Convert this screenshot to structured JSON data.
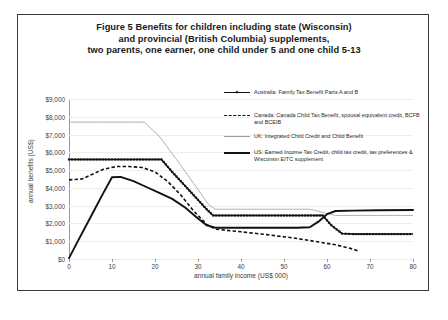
{
  "figure": {
    "title_lines": [
      "Figure 5   Benefits for children including state (Wisconsin)",
      "and provincial (British Columbia) supplements,",
      "two parents, one earner, one child under 5 and one child 5-13"
    ]
  },
  "chart_data": {
    "type": "line",
    "title": "Figure 5   Benefits for children including state (Wisconsin) and provincial (British Columbia) supplements, two parents, one earner, one child under 5 and one child 5-13",
    "xlabel": "annual family income (US$ 000)",
    "ylabel": "annual benefits (US$)",
    "xlim": [
      0,
      80
    ],
    "ylim": [
      0,
      9000
    ],
    "xticks": [
      0,
      10,
      20,
      30,
      40,
      50,
      60,
      70,
      80
    ],
    "xticklabels": [
      "0",
      "10",
      "20",
      "30",
      "40",
      "50",
      "60",
      "70",
      "80"
    ],
    "yticks": [
      0,
      1000,
      2000,
      3000,
      4000,
      5000,
      6000,
      7000,
      8000,
      9000
    ],
    "yticklabels": [
      "$0",
      "$1,000",
      "$2,000",
      "$3,000",
      "$4,000",
      "$5,000",
      "$6,000",
      "$7,000",
      "$8,000",
      "$9,000"
    ],
    "grid": false,
    "legend_position": "upper right",
    "series": [
      {
        "name": "Australia: Family Tax Benefit Parts A and B",
        "key": "australia",
        "style": "solid-with-markers",
        "color": "#111111",
        "points": [
          [
            0,
            5600
          ],
          [
            10,
            5600
          ],
          [
            18,
            5600
          ],
          [
            21.5,
            5600
          ],
          [
            24,
            4900
          ],
          [
            28,
            3850
          ],
          [
            32,
            2800
          ],
          [
            33.5,
            2450
          ],
          [
            40,
            2450
          ],
          [
            50,
            2450
          ],
          [
            57,
            2450
          ],
          [
            59,
            2450
          ],
          [
            61,
            1900
          ],
          [
            63.5,
            1430
          ],
          [
            66,
            1400
          ],
          [
            70,
            1400
          ],
          [
            75,
            1400
          ],
          [
            80,
            1400
          ]
        ]
      },
      {
        "name": "Canada: Canada Child Tax Benefit, spousal equivalent credit, BCFB and BCEIB",
        "key": "canada",
        "style": "dashed",
        "color": "#111111",
        "points": [
          [
            0,
            4450
          ],
          [
            3,
            4500
          ],
          [
            5,
            4720
          ],
          [
            8,
            5050
          ],
          [
            11,
            5200
          ],
          [
            14,
            5200
          ],
          [
            17,
            5150
          ],
          [
            20,
            4900
          ],
          [
            23,
            4350
          ],
          [
            26,
            3600
          ],
          [
            29,
            2700
          ],
          [
            32,
            1950
          ],
          [
            34,
            1680
          ],
          [
            40,
            1530
          ],
          [
            46,
            1370
          ],
          [
            52,
            1190
          ],
          [
            58,
            960
          ],
          [
            62,
            800
          ],
          [
            66,
            560
          ],
          [
            67.5,
            420
          ]
        ]
      },
      {
        "name": "UK: Integrated Child Credit and Child Benefit",
        "key": "uk",
        "style": "thin-solid",
        "color": "#9d9d9d",
        "points": [
          [
            0,
            7700
          ],
          [
            8,
            7700
          ],
          [
            15,
            7700
          ],
          [
            17.5,
            7700
          ],
          [
            21,
            6900
          ],
          [
            25,
            5600
          ],
          [
            29,
            4250
          ],
          [
            32.5,
            3050
          ],
          [
            34,
            2800
          ],
          [
            40,
            2800
          ],
          [
            48,
            2800
          ],
          [
            52,
            2800
          ],
          [
            56,
            2800
          ],
          [
            59,
            2620
          ],
          [
            62,
            2450
          ],
          [
            66,
            2450
          ],
          [
            72,
            2450
          ],
          [
            80,
            2450
          ]
        ]
      },
      {
        "name": "US: Earned Income Tax Credit, child tax credit, tax preferences & Wisconsin EITC supplement",
        "key": "us",
        "style": "thick-solid",
        "color": "#111111",
        "points": [
          [
            0,
            50
          ],
          [
            2,
            980
          ],
          [
            5,
            2350
          ],
          [
            8,
            3720
          ],
          [
            10,
            4600
          ],
          [
            12,
            4620
          ],
          [
            15,
            4380
          ],
          [
            18,
            4050
          ],
          [
            21,
            3720
          ],
          [
            24,
            3380
          ],
          [
            27,
            2900
          ],
          [
            30,
            2280
          ],
          [
            32,
            1900
          ],
          [
            34,
            1760
          ],
          [
            40,
            1760
          ],
          [
            47,
            1760
          ],
          [
            53,
            1760
          ],
          [
            56,
            1790
          ],
          [
            58,
            2100
          ],
          [
            60,
            2520
          ],
          [
            62,
            2700
          ],
          [
            66,
            2720
          ],
          [
            72,
            2740
          ],
          [
            80,
            2760
          ]
        ]
      }
    ],
    "legend_entries": [
      {
        "label": "Australia: Family Tax Benefit Parts A and B",
        "style": "solid-with-markers"
      },
      {
        "label": "Canada: Canada Child Tax Benefit, spousal equivalent credit, BCFB and BCEIB",
        "style": "dashed"
      },
      {
        "label": "UK: Integrated Child Credit and Child Benefit",
        "style": "thin-solid"
      },
      {
        "label": "US: Earned Income Tax Credit, child tax credit, tax preferences & Wisconsin EITC supplement",
        "style": "thick-solid"
      }
    ]
  }
}
